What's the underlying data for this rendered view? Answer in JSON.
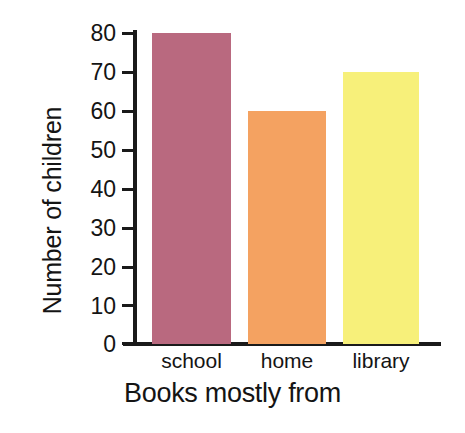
{
  "chart_data": {
    "type": "bar",
    "title": "",
    "subtitle": "",
    "xlabel": "Books mostly from",
    "ylabel": "Number of children",
    "categories": [
      "school",
      "home",
      "library"
    ],
    "values": [
      80,
      60,
      70
    ],
    "series": [
      {
        "name": "Number of children",
        "values": [
          80,
          60,
          70
        ]
      }
    ],
    "ylim": [
      0,
      80
    ],
    "yticks": [
      0,
      10,
      20,
      30,
      40,
      50,
      60,
      70,
      80
    ],
    "ytick_labels": [
      "0",
      "10",
      "20",
      "30",
      "40",
      "50",
      "60",
      "70",
      "80"
    ],
    "grid": false,
    "legend": false,
    "legend_position": "none",
    "bar_colors": [
      "#b9697f",
      "#f4a261",
      "#f7f07a"
    ],
    "axis_color": "#1a1a1a",
    "background_color": "#ffffff",
    "annotations": []
  },
  "bars": [
    {
      "label": "school",
      "value": 80,
      "color": "#b9697f"
    },
    {
      "label": "home",
      "value": 60,
      "color": "#f4a261"
    },
    {
      "label": "library",
      "value": 70,
      "color": "#f7f07a"
    }
  ],
  "axes": {
    "y_title": "Number of children",
    "x_title": "Books mostly from",
    "y_ticks": [
      {
        "label": "80"
      },
      {
        "label": "70"
      },
      {
        "label": "60"
      },
      {
        "label": "50"
      },
      {
        "label": "40"
      },
      {
        "label": "30"
      },
      {
        "label": "20"
      },
      {
        "label": "10"
      },
      {
        "label": "0"
      }
    ]
  }
}
